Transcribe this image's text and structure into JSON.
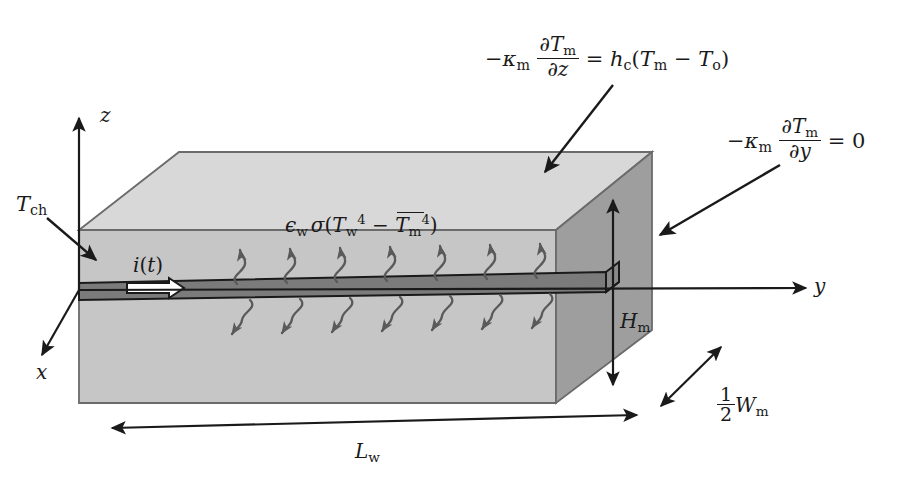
{
  "figure": {
    "type": "schematic-diagram",
    "background_color": "#ffffff",
    "line_color": "#1a1a1a"
  },
  "colors": {
    "top_face": "#d8d8d8",
    "front_face": "#c6c6c6",
    "right_face": "#9e9e9e",
    "wire": "#7b7b7b",
    "edge": "#6b6b6b",
    "stroke": "#1a1a1a",
    "wave_arrow": "#5a5a5a"
  },
  "equations": {
    "top_bc": {
      "name": "convective-boundary-condition",
      "minus": "−",
      "kappa": "κ",
      "kappa_sub": "m",
      "partial": "∂",
      "num_var": "T",
      "num_sub": "m",
      "den_var": "z",
      "equals": "=",
      "h": "h",
      "h_sub": "c",
      "open": "(",
      "t1": "T",
      "t1_sub": "m",
      "dash": "−",
      "t2": "T",
      "t2_sub": "o",
      "close": ")"
    },
    "right_bc": {
      "name": "adiabatic-boundary-condition",
      "minus": "−",
      "kappa": "κ",
      "kappa_sub": "m",
      "partial": "∂",
      "num_var": "T",
      "num_sub": "m",
      "den_var": "y",
      "equals": "=",
      "zero": "0"
    },
    "radiation": {
      "name": "radiative-exchange-term",
      "epsilon": "ϵ",
      "epsilon_sub": "w",
      "sigma": "σ",
      "open": "(",
      "t1": "T",
      "t1_sub": "w",
      "t1_sup": "4",
      "dash": "−",
      "t2": "T",
      "t2_sub": "m",
      "t2_sup": "4",
      "close": ")"
    }
  },
  "labels": {
    "chip_temperature": {
      "var": "T",
      "sub": "ch"
    },
    "current": {
      "text": "i(t)",
      "var": "i",
      "open": "(",
      "t": "t",
      "close": ")"
    },
    "height": {
      "var": "H",
      "sub": "m"
    },
    "length": {
      "var": "L",
      "sub": "w"
    },
    "half_width": {
      "num": "1",
      "den": "2",
      "var": "W",
      "sub": "m"
    }
  },
  "axes": {
    "z": {
      "label": "z",
      "direction": "up"
    },
    "y": {
      "label": "y",
      "direction": "right"
    },
    "x": {
      "label": "x",
      "direction": "down-left"
    }
  },
  "annotations": {
    "wave_arrow_count_top": 7,
    "wave_arrow_count_bottom": 7
  }
}
